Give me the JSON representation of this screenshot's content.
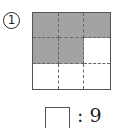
{
  "problem": {
    "number": "1",
    "grid": {
      "rows": 3,
      "cols": 3,
      "shaded": [
        [
          1,
          1,
          1
        ],
        [
          1,
          1,
          0
        ],
        [
          0,
          0,
          0
        ]
      ],
      "shaded_color": "#a3a3a3"
    },
    "answer_blank": "",
    "ratio_text": ": 9"
  }
}
